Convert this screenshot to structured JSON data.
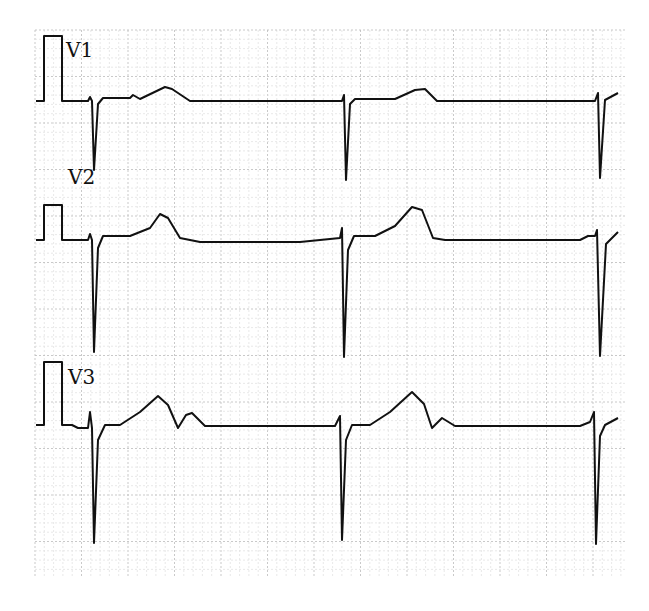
{
  "chart_data": {
    "type": "line",
    "xlabel": "",
    "ylabel": "",
    "grid": true,
    "leads": [
      {
        "name": "V1",
        "label_x": 66,
        "label_y": 38,
        "baseline": 101,
        "cal": "M36,101 H44 V36 H62 V101 H70",
        "trace": "M70,101 H88 L90,97 L92,101 L94,170 L98,104 L103,98 H130 L133,95 L140,99 L165,87 L172,89 L190,101 H230 H342 L344,95 L346,180 L350,104 L355,99 H395 L415,90 L425,89 L437,101 H595 L598,93 L600,178 L605,100 L618,93"
      },
      {
        "name": "V2",
        "label_x": 68,
        "label_y": 168,
        "baseline": 240,
        "cal": "M36,240 H44 V205 H62 V240 H70",
        "trace": "M70,240 H88 L90,234 L92,240 L94,352 L98,248 L103,236 H130 L150,228 L160,214 L168,218 L180,238 L200,242 H300 L340,238 L342,228 L344,357 L348,250 L354,236 H375 L395,226 L412,207 L422,210 L433,238 L445,240 H580 L588,236 L595,236 L597,230 L600,356 L606,244 L618,232"
      },
      {
        "name": "V3",
        "label_x": 68,
        "label_y": 368,
        "baseline": 425,
        "cal": "M36,425 H44 V362 H62 V425 H72 L78,428 H88 L90,412 L92,428 L94,543 L98,440 L105,425 H120 L140,412 L158,396 L168,405 L178,428 L186,415 L192,413 L205,426 H335 L340,416 L342,540 L346,440 L352,425 H370 L390,412 L412,392 L424,404 L432,428 L442,418 L455,426 H580 L590,422 L594,412 L596,544 L600,436 L605,425 L618,418",
        "trace": ""
      }
    ]
  }
}
